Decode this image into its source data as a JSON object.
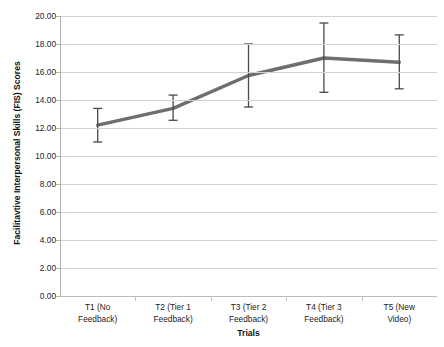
{
  "chart_data": {
    "type": "line",
    "title": "",
    "xlabel": "Trials",
    "ylabel": "Facilitavtive Interpersonal Skills (FIS) Scores",
    "categories": [
      "T1 (No Feedback)",
      "T2 (Tier 1 Feedback)",
      "T3 (Tier 2 Feedback)",
      "T4 (Tier 3 Feedback)",
      "T5 (New Video)"
    ],
    "category_lines": [
      [
        "T1 (No",
        "Feedback)"
      ],
      [
        "T2 (Tier 1",
        "Feedback)"
      ],
      [
        "T3 (Tier 2",
        "Feedback)"
      ],
      [
        "T4 (Tier 3",
        "Feedback)"
      ],
      [
        "T5 (New",
        "Video)"
      ]
    ],
    "values": [
      12.2,
      13.4,
      15.75,
      17.0,
      16.7
    ],
    "error_low": [
      11.0,
      12.55,
      13.5,
      14.55,
      14.8
    ],
    "error_high": [
      13.4,
      14.35,
      18.0,
      19.5,
      18.65
    ],
    "ylim": [
      0.0,
      20.0
    ],
    "ytick_step": 2.0,
    "ytick_labels": [
      "20.00",
      "18.00",
      "16.00",
      "14.00",
      "12.00",
      "10.00",
      "8.00",
      "6.00",
      "4.00",
      "2.00",
      "0.00"
    ],
    "ytick_values": [
      20,
      18,
      16,
      14,
      12,
      10,
      8,
      6,
      4,
      2,
      0
    ],
    "grid": true,
    "legend": "none",
    "series_color": "#6e6e6e",
    "errorbar_color": "#4a4a4a",
    "grid_color": "#d2d2d2",
    "axis_color": "#b4b4b4",
    "marker": "none"
  }
}
